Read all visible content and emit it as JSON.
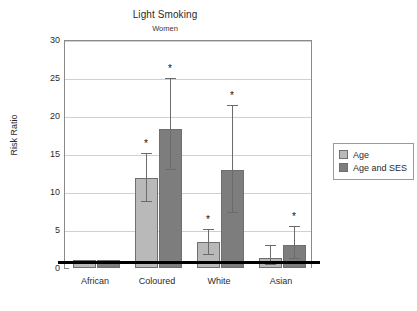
{
  "chart_data": {
    "type": "bar",
    "title": "Light Smoking",
    "subtitle": "Women",
    "xlabel": "",
    "ylabel": "Risk Ratio",
    "ylim": [
      0,
      30
    ],
    "yticks": [
      0,
      5,
      10,
      15,
      20,
      25,
      30
    ],
    "grid": true,
    "legend_position": "right",
    "reference_line": 1,
    "categories": [
      "African",
      "Coloured",
      "White",
      "Asian"
    ],
    "series": [
      {
        "name": "Age",
        "color": "#b9b9b9",
        "values": [
          1.0,
          11.8,
          3.4,
          1.3
        ],
        "ci_low": [
          null,
          9.0,
          2.0,
          0.6
        ],
        "ci_high": [
          null,
          15.3,
          5.3,
          3.1
        ],
        "significant": [
          false,
          true,
          true,
          false
        ]
      },
      {
        "name": "Age and SES",
        "color": "#7d7d7d",
        "values": [
          1.0,
          18.3,
          12.9,
          3.0
        ],
        "ci_low": [
          null,
          13.2,
          7.5,
          1.4
        ],
        "ci_high": [
          null,
          25.1,
          21.6,
          5.6
        ],
        "significant": [
          false,
          true,
          true,
          true
        ]
      }
    ]
  },
  "legend": {
    "items": [
      {
        "label": "Age"
      },
      {
        "label": "Age and SES"
      }
    ]
  },
  "annotations": {
    "significance_marker": "*"
  }
}
